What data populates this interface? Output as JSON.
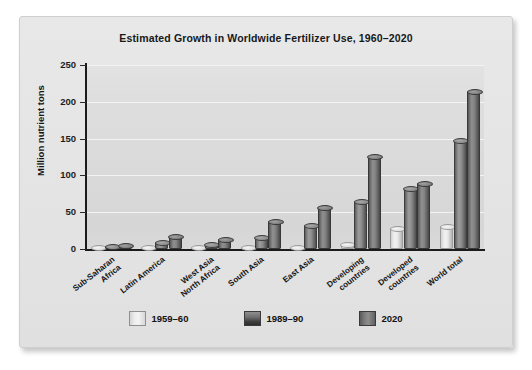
{
  "chart_data": {
    "type": "bar",
    "title": "Estimated Growth in Worldwide Fertilizer Use, 1960–2020",
    "xlabel": "",
    "ylabel": "Million nutrient tons",
    "ylim": [
      0,
      250
    ],
    "yticks": [
      0,
      50,
      100,
      150,
      200,
      250
    ],
    "ytick_labels": [
      "0",
      "50",
      "100",
      "150",
      "200",
      "250"
    ],
    "grid": true,
    "legend_position": "bottom",
    "categories": [
      "Sub-Saharan\nAfrica",
      "Latin America",
      "West Asia\nNorth Africa",
      "South Asia",
      "East Asia",
      "Developing\ncountries",
      "Developed\ncountries",
      "World total"
    ],
    "series": [
      {
        "name": "1959–60",
        "color": "#eaeaea",
        "values": [
          1,
          2,
          1,
          2,
          3,
          7,
          28,
          31
        ]
      },
      {
        "name": "1989–90",
        "color": "#7d7d7d",
        "values": [
          4,
          9,
          7,
          16,
          33,
          65,
          83,
          148
        ]
      },
      {
        "name": "2020",
        "color": "#5e5e5e",
        "values": [
          6,
          18,
          13,
          38,
          57,
          126,
          90,
          215
        ]
      }
    ]
  },
  "legend": {
    "items": [
      {
        "label": "1959–60"
      },
      {
        "label": "1989–90"
      },
      {
        "label": "2020"
      }
    ]
  }
}
